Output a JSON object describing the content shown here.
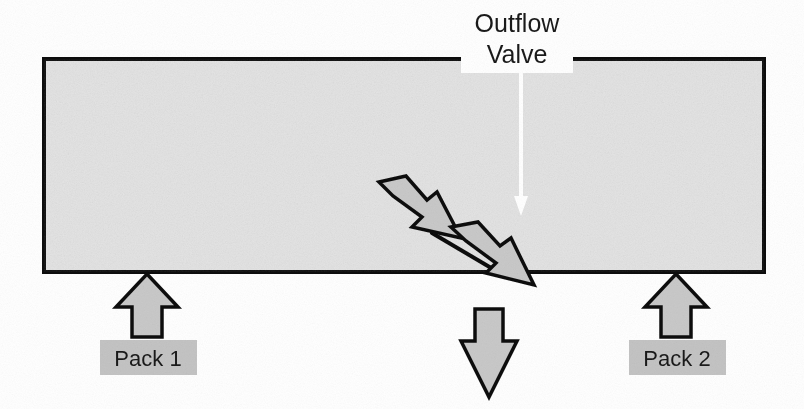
{
  "figure": {
    "title_label": "Outflow Valve",
    "valve_label_line1": "Outflow",
    "valve_label_line2": "Valve",
    "pack1_label": "Pack 1",
    "pack2_label": "Pack 2",
    "colors": {
      "tank_fill": "#e4e4e4",
      "tank_border": "#111111",
      "arrow_fill": "#c9c9c9",
      "arrow_border": "#111111",
      "label_box_fill": "#c4c4c4",
      "valve_box_fill": "#ffffff",
      "valve_arrow_fill": "#ffffff",
      "text": "#1a1a1a",
      "background": "#ffffff"
    },
    "elements": {
      "tank": "cabin-pressure-vessel",
      "outflow_valve_arrow": "white-downward-arrow-inside-tank",
      "pack1_arrow": "upward-inflow-arrow-left",
      "pack2_arrow": "upward-inflow-arrow-right",
      "leak_arrow_1": "diagonal-leak-arrow-upper",
      "leak_arrow_2": "diagonal-leak-arrow-lower",
      "outflow_arrow": "downward-outflow-arrow-below-tank",
      "crack": "breach-line-in-lower-wall"
    }
  }
}
